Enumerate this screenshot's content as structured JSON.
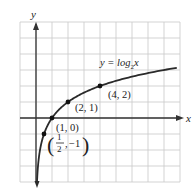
{
  "chart_data": {
    "type": "line",
    "title": "",
    "xlabel": "x",
    "ylabel": "y",
    "function_label": "y = log₂x",
    "function_label_parts": {
      "prefix": "y = log",
      "sub": "2",
      "suffix": "x"
    },
    "xlim": [
      -1,
      9
    ],
    "ylim": [
      -4,
      6
    ],
    "grid": true,
    "grid_step": 1,
    "series": [
      {
        "name": "y = log2 x",
        "x": [
          0.0625,
          0.125,
          0.25,
          0.5,
          1,
          2,
          4,
          8.8
        ],
        "y": [
          -4,
          -3,
          -2,
          -1,
          0,
          1,
          2,
          3.14
        ]
      }
    ],
    "points": [
      {
        "x": 0.5,
        "y": -1,
        "label_num": "1",
        "label_den": "2",
        "label_y": "−1"
      },
      {
        "x": 1,
        "y": 0,
        "label": "(1, 0)"
      },
      {
        "x": 2,
        "y": 1,
        "label": "(2, 1)"
      },
      {
        "x": 4,
        "y": 2,
        "label": "(4, 2)"
      }
    ]
  },
  "colors": {
    "grid": "#c8c8c8",
    "axis": "#333333",
    "curve": "#2a2a2a",
    "background": "#ffffff"
  }
}
